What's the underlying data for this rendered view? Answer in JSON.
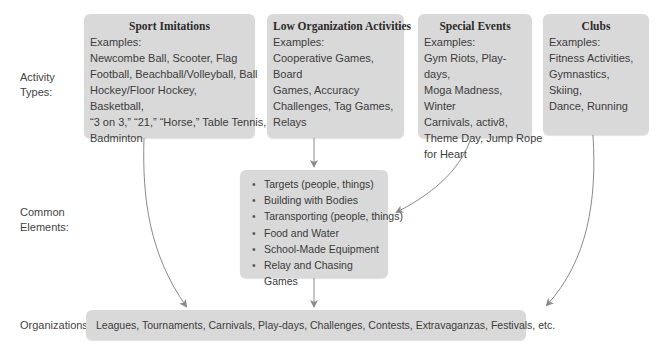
{
  "row_labels": {
    "activity_types": [
      "Activity",
      "Types:"
    ],
    "common_elements": [
      "Common",
      "Elements:"
    ],
    "organizations": "Organizations:"
  },
  "activity_types": [
    {
      "title": "Sport Imitations",
      "examples_label": "Examples:",
      "examples_lines": [
        "Newcombe Ball, Scooter, Flag",
        "Football, Beachball/Volleyball, Ball",
        "Hockey/Floor Hockey, Basketball,",
        "“3 on 3,” “21,” “Horse,” Table Tennis,",
        "Badminton"
      ]
    },
    {
      "title": "Low Organization Activities",
      "examples_label": "Examples:",
      "examples_lines": [
        "Cooperative Games, Board",
        "Games, Accuracy",
        "Challenges, Tag Games,",
        "Relays"
      ]
    },
    {
      "title": "Special Events",
      "examples_label": "Examples:",
      "examples_lines": [
        "Gym Riots, Play-days,",
        "Moga Madness, Winter",
        "Carnivals, activ8,",
        "Theme Day, Jump Rope",
        "for Heart"
      ]
    },
    {
      "title": "Clubs",
      "examples_label": "Examples:",
      "examples_lines": [
        "Fitness Activities,",
        "Gymnastics, Skiing,",
        "Dance, Running"
      ]
    }
  ],
  "common_elements": [
    "Targets (people, things)",
    "Building with Bodies",
    "Taransporting (people, things)",
    "Food and Water",
    "School-Made Equipment",
    "Relay and Chasing Games"
  ],
  "organizations": "Leagues, Tournaments, Carnivals, Play-days, Challenges, Contests, Extravaganzas, Festivals, etc.",
  "colors": {
    "box_fill": "#d9d9d9",
    "arrow": "#8a8a8a",
    "text": "#3a3a3a"
  }
}
